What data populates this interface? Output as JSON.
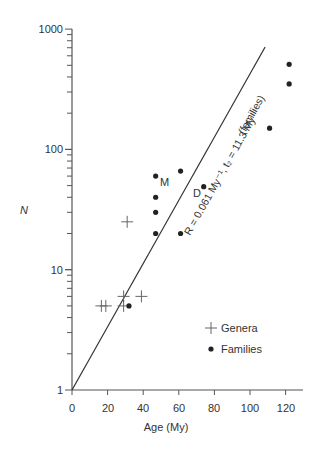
{
  "chart_data": {
    "type": "scatter",
    "title": "",
    "xlabel": "Age (My)",
    "ylabel": "N",
    "xscale": "linear",
    "yscale": "log",
    "xlim": [
      0,
      130
    ],
    "ylim": [
      1,
      1000
    ],
    "xticks": [
      0,
      20,
      40,
      60,
      80,
      100,
      120
    ],
    "yticks": [
      1,
      10,
      100,
      1000
    ],
    "grid": false,
    "legend_position": "lower right",
    "series": [
      {
        "name": "Genera",
        "marker": "plus",
        "points": [
          {
            "x": 31,
            "y": 25
          },
          {
            "x": 16.5,
            "y": 5
          },
          {
            "x": 19,
            "y": 5
          },
          {
            "x": 29,
            "y": 6
          },
          {
            "x": 39,
            "y": 6
          },
          {
            "x": 29,
            "y": 5
          }
        ]
      },
      {
        "name": "Families",
        "marker": "dot",
        "points": [
          {
            "x": 47,
            "y": 60,
            "label": "M"
          },
          {
            "x": 61,
            "y": 66
          },
          {
            "x": 47,
            "y": 40
          },
          {
            "x": 47,
            "y": 30
          },
          {
            "x": 47,
            "y": 20
          },
          {
            "x": 61,
            "y": 20
          },
          {
            "x": 74,
            "y": 49,
            "label": "D"
          },
          {
            "x": 32,
            "y": 5
          },
          {
            "x": 111,
            "y": 150
          },
          {
            "x": 122,
            "y": 350
          },
          {
            "x": 122,
            "y": 510
          }
        ]
      }
    ],
    "fit_line": {
      "from": {
        "x": 0,
        "y": 1
      },
      "to": {
        "x": 108.5,
        "y": 710
      },
      "annotation": "R = 0.061 My⁻¹, t₂ = 11.3 My",
      "annotation_sub": "(families)"
    }
  },
  "labels": {
    "x_axis": "Age (My)",
    "y_axis": "N",
    "legend_genera": "Genera",
    "legend_families": "Families",
    "fit_annotation": "R = 0.061 My⁻¹, t₂ = 11.3 My",
    "fit_annotation_sub": "(families)",
    "point_label_m": "M",
    "point_label_d": "D",
    "ytick_1": "1",
    "ytick_10": "10",
    "ytick_100": "100",
    "ytick_1000": "1000",
    "xtick_0": "0",
    "xtick_20": "20",
    "xtick_40": "40",
    "xtick_60": "60",
    "xtick_80": "80",
    "xtick_100": "100",
    "xtick_120": "120"
  },
  "colors": {
    "axis": "#555555",
    "marker": "#222222",
    "cross": "#666666",
    "text": "#333333"
  }
}
